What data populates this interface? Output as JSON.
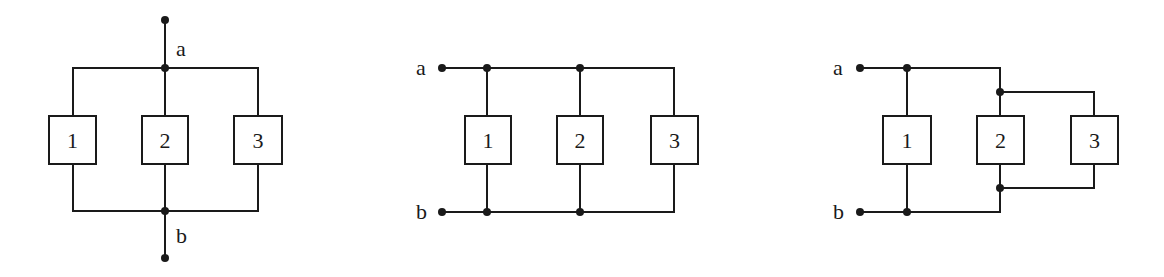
{
  "colors": {
    "ink": "#1a1a1a",
    "background": "#ffffff"
  },
  "diagrams": [
    {
      "id": "parallel-vertical",
      "terminal_labels": {
        "a": "a",
        "b": "b"
      },
      "components": [
        {
          "label": "1"
        },
        {
          "label": "2"
        },
        {
          "label": "3"
        }
      ],
      "topology": "1, 2, 3 all in parallel between a and b"
    },
    {
      "id": "parallel-horizontal",
      "terminal_labels": {
        "a": "a",
        "b": "b"
      },
      "components": [
        {
          "label": "1"
        },
        {
          "label": "2"
        },
        {
          "label": "3"
        }
      ],
      "topology": "1, 2, 3 all in parallel between a and b"
    },
    {
      "id": "parallel-nested",
      "terminal_labels": {
        "a": "a",
        "b": "b"
      },
      "components": [
        {
          "label": "1"
        },
        {
          "label": "2"
        },
        {
          "label": "3"
        }
      ],
      "topology": "1 in parallel with (2 parallel 3) between a and b"
    }
  ]
}
